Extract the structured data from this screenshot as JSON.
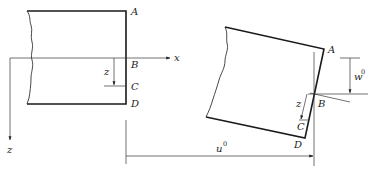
{
  "figure": {
    "left": {
      "points": {
        "A": "A",
        "B": "B",
        "C": "C",
        "D": "D"
      },
      "axes": {
        "x": "x",
        "z": "z"
      },
      "local_z": "z"
    },
    "right": {
      "points": {
        "A": "A",
        "B": "B",
        "C": "C",
        "D": "D"
      },
      "local_z": "z",
      "displacements": {
        "vertical": {
          "symbol": "w",
          "superscript": "0"
        },
        "horizontal": {
          "symbol": "u",
          "superscript": "0"
        }
      }
    }
  }
}
